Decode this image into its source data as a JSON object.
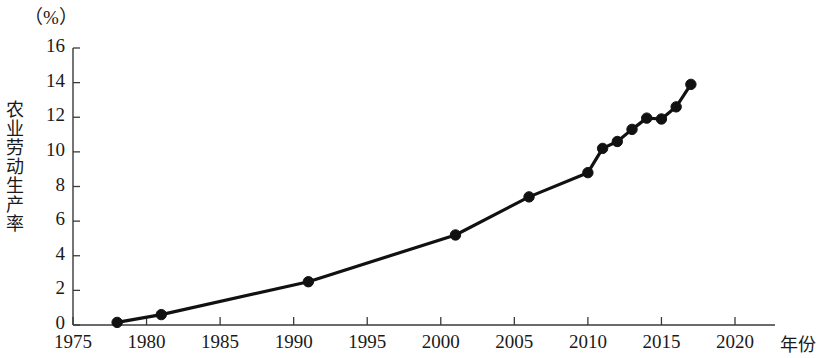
{
  "chart_data": {
    "type": "line",
    "title": "",
    "subtitle": "",
    "unit_label": "（%）",
    "ylabel": "农业劳动生产率",
    "xlabel": "年份",
    "xlim": [
      1975,
      2020
    ],
    "ylim": [
      0,
      16
    ],
    "grid": false,
    "legend": null,
    "legend_position": "none",
    "x_ticks": [
      1975,
      1980,
      1985,
      1990,
      1995,
      2000,
      2005,
      2010,
      2015,
      2020
    ],
    "x_tick_labels": [
      "1975",
      "1980",
      "1985",
      "1990",
      "1995",
      "2000",
      "2005",
      "2010",
      "2015",
      "2020"
    ],
    "y_ticks": [
      0,
      2,
      4,
      6,
      8,
      10,
      12,
      14,
      16
    ],
    "y_tick_labels": [
      "0",
      "2",
      "4",
      "6",
      "8",
      "10",
      "12",
      "14",
      "16"
    ],
    "line_color": "#111111",
    "marker_color": "#111111",
    "marker_shape": "circle",
    "x": [
      1978,
      1981,
      1991,
      2001,
      2006,
      2010,
      2011,
      2012,
      2013,
      2014,
      2015,
      2016,
      2017
    ],
    "values": [
      0.15,
      0.6,
      2.5,
      5.2,
      7.4,
      8.8,
      10.2,
      10.6,
      11.3,
      11.95,
      11.9,
      12.6,
      13.9
    ],
    "series": [
      {
        "name": "农业劳动生产率",
        "x": [
          1978,
          1981,
          1991,
          2001,
          2006,
          2010,
          2011,
          2012,
          2013,
          2014,
          2015,
          2016,
          2017
        ],
        "values": [
          0.15,
          0.6,
          2.5,
          5.2,
          7.4,
          8.8,
          10.2,
          10.6,
          11.3,
          11.95,
          11.9,
          12.6,
          13.9
        ]
      }
    ],
    "annotations": []
  }
}
